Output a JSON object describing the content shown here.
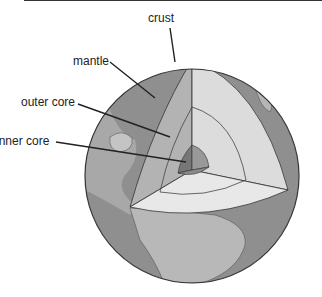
{
  "diagram": {
    "labels": {
      "crust": "crust",
      "mantle": "mantle",
      "outer_core": "outer core",
      "inner_core": "inner core"
    }
  },
  "colors": {
    "ocean": "#8f8f8f",
    "land": "#c4c4c4",
    "mantle_face": "#b0b0b0",
    "outer_core_face": "#d6d6d6",
    "inner_core_face": "#7a7a7a",
    "outline": "#333333"
  }
}
